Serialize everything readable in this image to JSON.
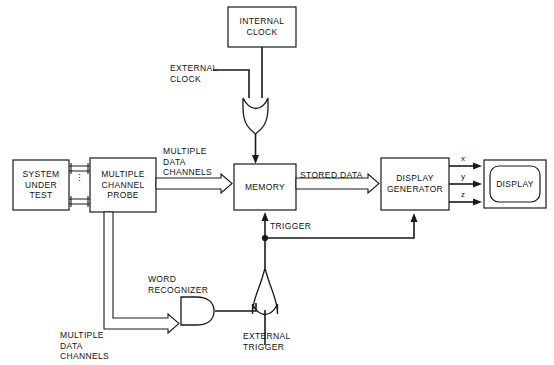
{
  "diagram": {
    "background_color": "#ffffff",
    "line_color": "#1a1a1a",
    "blocks": {
      "internal_clock": "INTERNAL\nCLOCK",
      "system_under_test": "SYSTEM\nUNDER\nTEST",
      "multiple_channel_probe": "MULTIPLE\nCHANNEL\nPROBE",
      "memory": "MEMORY",
      "display_generator": "DISPLAY\nGENERATOR",
      "display": "DISPLAY"
    },
    "labels": {
      "external_clock": "EXTERNAL\nCLOCK",
      "multiple_data_channels_top": "MULTIPLE\nDATA\nCHANNELS",
      "stored_data": "STORED DATA",
      "trigger": "TRIGGER",
      "word_recognizer": "WORD\nRECOGNIZER",
      "multiple_data_channels_bottom": "MULTIPLE\nDATA\nCHANNELS",
      "external_trigger": "EXTERNAL\nTRIGGER",
      "axis_x": "x",
      "axis_y": "y",
      "axis_z": "z",
      "channel_ellipsis": "⋮"
    },
    "gates": {
      "clock_or_gate": "or-gate",
      "trigger_or_gate": "or-gate",
      "word_recognizer_and_gate": "and-gate"
    }
  }
}
